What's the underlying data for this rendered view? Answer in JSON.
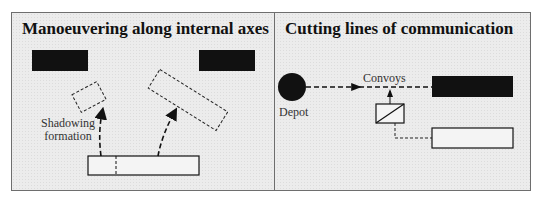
{
  "panels": [
    {
      "title": "Manoeuvering along internal axes",
      "labels": {
        "shadowing": "Shadowing formation"
      }
    },
    {
      "title": "Cutting lines of communication",
      "labels": {
        "convoys": "Convoys",
        "depot": "Depot"
      }
    }
  ],
  "colors": {
    "background": "#ececec",
    "ink": "#111111",
    "border": "#6e6e6e"
  }
}
